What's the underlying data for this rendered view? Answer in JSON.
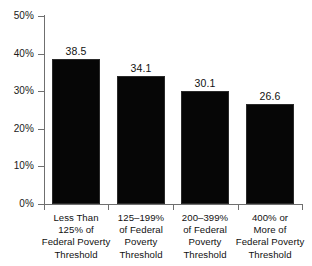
{
  "chart_data": {
    "type": "bar",
    "title": "",
    "xlabel": "",
    "ylabel": "",
    "ylim": [
      0,
      50
    ],
    "grid": false,
    "legend": null,
    "y_tick_labels": [
      "50%",
      "40%",
      "30%",
      "20%",
      "10%",
      "0%"
    ],
    "y_tick_values": [
      50,
      40,
      30,
      20,
      10,
      0
    ],
    "categories": [
      "Less Than\n125% of\nFederal Poverty\nThreshold",
      "125–199%\nof Federal\nPoverty\nThreshold",
      "200–399%\nof Federal\nPoverty\nThreshold",
      "400% or\nMore of\nFederal Poverty\nThreshold"
    ],
    "values": [
      38.5,
      34.1,
      30.1,
      26.6
    ],
    "value_labels": [
      "38.5",
      "34.1",
      "30.1",
      "26.6"
    ],
    "bar_color": "#060606",
    "axis_color": "#6f6f6f",
    "text_color": "#111111"
  }
}
